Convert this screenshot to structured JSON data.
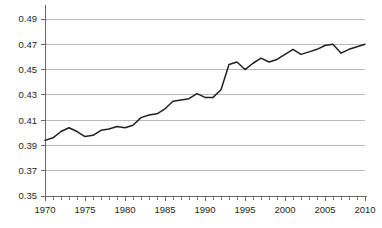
{
  "chart_data": {
    "type": "line",
    "title": "",
    "subtitle": "",
    "xlabel": "",
    "ylabel": "",
    "xlim": [
      1970,
      2010
    ],
    "ylim": [
      0.35,
      0.49
    ],
    "grid": true,
    "legend": false,
    "legend_position": "none",
    "line_color": "#231f20",
    "grid_color": "#a7a9ac",
    "axis_color": "#58595b",
    "y_ticks": [
      0.35,
      0.37,
      0.39,
      0.41,
      0.43,
      0.45,
      0.47,
      0.49
    ],
    "y_tick_labels": [
      "0.35",
      "0.37",
      "0.39",
      "0.41",
      "0.43",
      "0.45",
      "0.47",
      "0.49"
    ],
    "x_ticks": [
      1970,
      1975,
      1980,
      1985,
      1990,
      1995,
      2000,
      2005,
      2010
    ],
    "x_tick_labels": [
      "1970",
      "1975",
      "1980",
      "1985",
      "1990",
      "1995",
      "2000",
      "2005",
      "2010"
    ],
    "x_minor_tick_interval": 1,
    "x": [
      1970,
      1971,
      1972,
      1973,
      1974,
      1975,
      1976,
      1977,
      1978,
      1979,
      1980,
      1981,
      1982,
      1983,
      1984,
      1985,
      1986,
      1987,
      1988,
      1989,
      1990,
      1991,
      1992,
      1993,
      1994,
      1995,
      1996,
      1997,
      1998,
      1999,
      2000,
      2001,
      2002,
      2003,
      2004,
      2005,
      2006,
      2007,
      2008,
      2009,
      2010
    ],
    "series": [
      {
        "name": "",
        "values": [
          0.394,
          0.396,
          0.401,
          0.404,
          0.401,
          0.397,
          0.398,
          0.402,
          0.403,
          0.405,
          0.404,
          0.406,
          0.412,
          0.414,
          0.415,
          0.419,
          0.425,
          0.426,
          0.427,
          0.431,
          0.428,
          0.428,
          0.434,
          0.454,
          0.456,
          0.45,
          0.455,
          0.459,
          0.456,
          0.458,
          0.462,
          0.466,
          0.462,
          0.464,
          0.466,
          0.469,
          0.47,
          0.463,
          0.466,
          0.468,
          0.47
        ]
      }
    ]
  },
  "axes": {
    "y_axis_name": "y-axis",
    "x_axis_name": "x-axis"
  }
}
